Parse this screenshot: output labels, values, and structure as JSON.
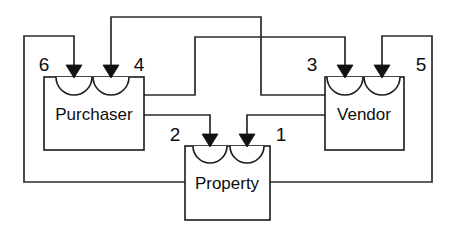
{
  "diagram": {
    "type": "component-connector-diagram",
    "canvas": {
      "width": 454,
      "height": 237,
      "background": "#ffffff"
    },
    "stroke_color": "#2b2b2b",
    "box_stroke_color": "#1a1a1a",
    "text_color": "#0d0d0d",
    "components": [
      {
        "id": "purchaser",
        "label": "Purchaser",
        "x": 44,
        "y": 77,
        "width": 100,
        "height": 73,
        "label_cx": 94,
        "label_cy": 116,
        "sockets": [
          {
            "port": "6",
            "cx": 74,
            "r": 18
          },
          {
            "port": "4",
            "cx": 111,
            "r": 18
          }
        ]
      },
      {
        "id": "property",
        "label": "Property",
        "x": 185,
        "y": 146,
        "width": 85,
        "height": 74,
        "label_cx": 227,
        "label_cy": 185,
        "sockets": [
          {
            "port": "2",
            "cx": 210,
            "r": 17
          },
          {
            "port": "1",
            "cx": 247,
            "r": 17
          }
        ]
      },
      {
        "id": "vendor",
        "label": "Vendor",
        "x": 325,
        "y": 77,
        "width": 79,
        "height": 73,
        "label_cx": 364,
        "label_cy": 116,
        "sockets": [
          {
            "port": "3",
            "cx": 345,
            "r": 18
          },
          {
            "port": "5",
            "cx": 382,
            "r": 18
          }
        ]
      }
    ],
    "port_labels": [
      {
        "id": "port-label-6",
        "text": "6",
        "x": 44,
        "y": 66
      },
      {
        "id": "port-label-4",
        "text": "4",
        "x": 139,
        "y": 66
      },
      {
        "id": "port-label-3",
        "text": "3",
        "x": 312,
        "y": 66
      },
      {
        "id": "port-label-5",
        "text": "5",
        "x": 421,
        "y": 66
      },
      {
        "id": "port-label-2",
        "text": "2",
        "x": 175,
        "y": 136
      },
      {
        "id": "port-label-1",
        "text": "1",
        "x": 281,
        "y": 136
      }
    ],
    "connectors": [
      {
        "id": "connector-property-to-purchaser-6",
        "from": "property-left",
        "to": "purchaser-port-6",
        "path": "M 185 182 L 24 182 L 24 36 L 74 36 L 74 66"
      },
      {
        "id": "connector-vendor-to-purchaser-4",
        "from": "vendor-left",
        "to": "purchaser-port-4",
        "path": "M 325 95 L 261 95 L 261 17 L 111 17 L 111 66"
      },
      {
        "id": "connector-purchaser-to-vendor-3",
        "from": "purchaser-right",
        "to": "vendor-port-3",
        "path": "M 144 95 L 195 95 L 195 37 L 345 37 L 345 66"
      },
      {
        "id": "connector-property-to-vendor-5",
        "from": "property-right",
        "to": "vendor-port-5",
        "path": "M 270 182 L 432 182 L 432 36 L 382 36 L 382 66"
      },
      {
        "id": "connector-purchaser-to-property-2",
        "from": "purchaser-right",
        "to": "property-port-2",
        "path": "M 144 115 L 210 115 L 210 135"
      },
      {
        "id": "connector-vendor-to-property-1",
        "from": "vendor-left",
        "to": "property-port-1",
        "path": "M 325 115 L 247 115 L 247 135"
      }
    ],
    "arrowheads": [
      {
        "id": "arrowhead-port-6",
        "cx": 74,
        "tip_y": 78
      },
      {
        "id": "arrowhead-port-4",
        "cx": 111,
        "tip_y": 78
      },
      {
        "id": "arrowhead-port-3",
        "cx": 345,
        "tip_y": 78
      },
      {
        "id": "arrowhead-port-5",
        "cx": 382,
        "tip_y": 78
      },
      {
        "id": "arrowhead-port-2",
        "cx": 210,
        "tip_y": 147
      },
      {
        "id": "arrowhead-port-1",
        "cx": 247,
        "tip_y": 147
      }
    ]
  }
}
